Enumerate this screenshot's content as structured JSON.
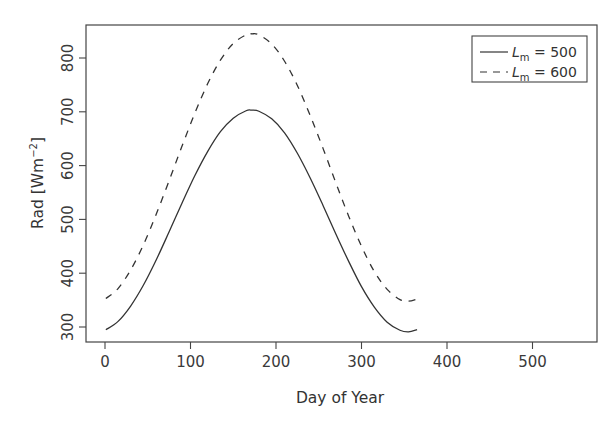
{
  "chart_data": {
    "type": "line",
    "title": "",
    "xlabel": "Day of Year",
    "ylabel": "Rad [Wm^-2]",
    "ylabel_parts": {
      "main": "Rad [Wm",
      "sup": "−2",
      "end": "]"
    },
    "xlim": [
      -5,
      575
    ],
    "ylim": [
      272,
      860
    ],
    "x_ticks": [
      0,
      100,
      200,
      300,
      400,
      500
    ],
    "x_tick_labels": [
      "0",
      "100",
      "200",
      "300",
      "400",
      "500"
    ],
    "y_ticks": [
      300,
      400,
      500,
      600,
      700,
      800
    ],
    "y_tick_labels": [
      "300",
      "400",
      "500",
      "600",
      "700",
      "800"
    ],
    "grid": false,
    "legend_position": "top-right",
    "x": [
      1,
      15,
      30,
      45,
      60,
      75,
      90,
      105,
      120,
      135,
      150,
      165,
      172,
      180,
      195,
      210,
      225,
      240,
      255,
      270,
      285,
      300,
      315,
      330,
      345,
      355,
      365
    ],
    "series": [
      {
        "name": "L_m = 500",
        "legend_label": {
          "var": "L",
          "sub": "m",
          "eq": "= 500"
        },
        "line_style": "solid",
        "color": "#333333",
        "values": [
          295,
          310,
          339,
          378,
          425,
          477,
          530,
          581,
          626,
          663,
          688,
          702,
          703,
          701,
          687,
          661,
          623,
          577,
          526,
          473,
          422,
          375,
          337,
          309,
          294,
          291,
          295
        ]
      },
      {
        "name": "L_m = 600",
        "legend_label": {
          "var": "L",
          "sub": "m",
          "eq": "= 600"
        },
        "line_style": "dashed",
        "color": "#333333",
        "values": [
          353,
          371,
          406,
          453,
          510,
          572,
          636,
          697,
          752,
          796,
          827,
          843,
          845,
          843,
          826,
          794,
          749,
          693,
          632,
          568,
          506,
          450,
          403,
          370,
          351,
          348,
          352
        ]
      }
    ]
  }
}
